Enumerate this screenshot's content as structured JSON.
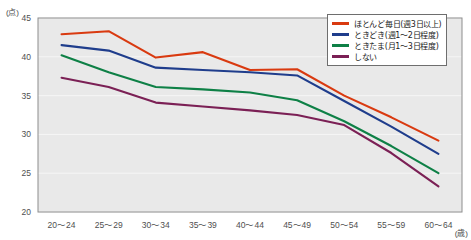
{
  "chart_data": {
    "type": "line",
    "title": "",
    "xlabel": "(歳)",
    "ylabel": "(点)",
    "categories": [
      "20〜24",
      "25〜29",
      "30〜34",
      "35〜39",
      "40〜44",
      "45〜49",
      "50〜54",
      "55〜59",
      "60〜64"
    ],
    "ylim": [
      20,
      45
    ],
    "yticks": [
      20,
      25,
      30,
      35,
      40,
      45
    ],
    "grid": true,
    "legend_position": "top-right",
    "series": [
      {
        "name": "ほとんど毎日(週3日以上)",
        "color": "#D93A10",
        "values": [
          42.9,
          43.3,
          39.9,
          40.6,
          38.3,
          38.4,
          35.0,
          32.2,
          29.2
        ]
      },
      {
        "name": "ときどき(週1〜2日程度)",
        "color": "#1F3D8C",
        "values": [
          41.5,
          40.8,
          38.6,
          38.3,
          38.0,
          37.6,
          34.3,
          31.0,
          27.5
        ]
      },
      {
        "name": "ときたま(月1〜3日程度)",
        "color": "#0E8046",
        "values": [
          40.2,
          38.0,
          36.1,
          35.8,
          35.4,
          34.4,
          31.7,
          28.5,
          25.0
        ]
      },
      {
        "name": "しない",
        "color": "#7B2055",
        "values": [
          37.3,
          36.1,
          34.1,
          33.6,
          33.1,
          32.5,
          31.2,
          27.6,
          23.3
        ]
      }
    ]
  },
  "plot": {
    "background": "#e9e9e9",
    "gridline_color": "#f6f6f6",
    "border_color": "#8d8d8d"
  }
}
